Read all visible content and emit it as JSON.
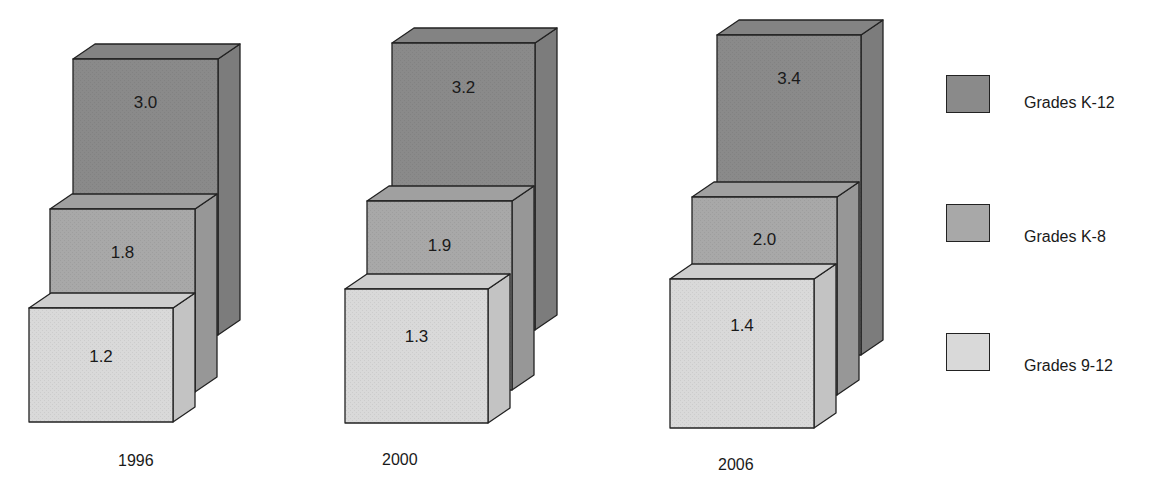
{
  "colors": {
    "k12": "#8a8a8a",
    "k8": "#a8a8a8",
    "g912": "#d9d9d9",
    "outline": "#222222"
  },
  "chart_data": {
    "type": "bar",
    "title": "",
    "xlabel": "",
    "ylabel": "",
    "style": "3d-stacked-overlapping-boxes",
    "categories": [
      "1996",
      "2000",
      "2006"
    ],
    "series": [
      {
        "name": "Grades K-12",
        "values": [
          3.0,
          3.2,
          3.4
        ]
      },
      {
        "name": "Grades K-8",
        "values": [
          1.8,
          1.9,
          2.0
        ]
      },
      {
        "name": "Grades 9-12",
        "values": [
          1.2,
          1.3,
          1.4
        ]
      }
    ],
    "value_labels": {
      "1996": {
        "k12": "3.0",
        "k8": "1.8",
        "g912": "1.2"
      },
      "2000": {
        "k12": "3.2",
        "k8": "1.9",
        "g912": "1.3"
      },
      "2006": {
        "k12": "3.4",
        "k8": "2.0",
        "g912": "1.4"
      }
    },
    "legend": {
      "position": "right",
      "entries": [
        "Grades K-12",
        "Grades K-8",
        "Grades 9-12"
      ]
    },
    "grid": false
  },
  "years": [
    "1996",
    "2000",
    "2006"
  ],
  "legend": {
    "k12": "Grades K-12",
    "k8": "Grades K-8",
    "g912": "Grades 9-12"
  }
}
